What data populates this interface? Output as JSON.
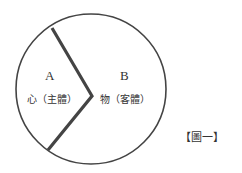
{
  "diagram": {
    "region_a": {
      "letter": "A",
      "label": "心（主體）"
    },
    "region_b": {
      "letter": "B",
      "label": "物（客體）"
    },
    "caption": "【圖一】",
    "colors": {
      "stroke": "#444444",
      "text": "#333333"
    }
  }
}
